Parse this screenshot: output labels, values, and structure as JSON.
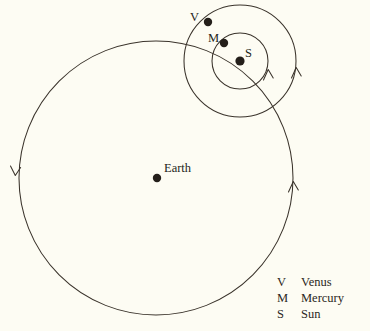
{
  "diagram": {
    "type": "orbital-diagram",
    "background_color": "#fdfcf3",
    "stroke_color": "#3a332b",
    "dot_color": "#241f1a",
    "labels": {
      "earth": "Earth",
      "venus": "V",
      "mercury": "M",
      "sun": "S"
    },
    "bodies": [
      {
        "name": "earth",
        "label": "Earth",
        "cx": 157,
        "cy": 178,
        "r": 4.2
      },
      {
        "name": "venus",
        "label": "V",
        "cx": 208,
        "cy": 22,
        "r": 4.2
      },
      {
        "name": "mercury",
        "label": "M",
        "cx": 224,
        "cy": 43,
        "r": 4.2
      },
      {
        "name": "sun",
        "label": "S",
        "cx": 240,
        "cy": 61,
        "r": 4.6
      }
    ],
    "orbits": [
      {
        "name": "sun-orbit-around-earth",
        "cx": 156,
        "cy": 178,
        "r": 137
      },
      {
        "name": "venus-orbit-around-sun",
        "cx": 240,
        "cy": 61,
        "r": 56
      },
      {
        "name": "mercury-orbit-around-sun",
        "cx": 240,
        "cy": 61,
        "r": 28
      }
    ],
    "direction_arrows": [
      {
        "name": "sun-orbit-arrow-left",
        "x": 15,
        "y": 174,
        "direction": "down"
      },
      {
        "name": "sun-orbit-arrow-right",
        "x": 293,
        "y": 184,
        "direction": "up"
      },
      {
        "name": "venus-orbit-arrow",
        "x": 296,
        "y": 69,
        "direction": "up"
      },
      {
        "name": "mercury-orbit-arrow",
        "x": 268,
        "y": 71,
        "direction": "up"
      }
    ]
  },
  "legend": {
    "rows": [
      {
        "symbol": "V",
        "name": "Venus"
      },
      {
        "symbol": "M",
        "name": "Mercury"
      },
      {
        "symbol": "S",
        "name": "Sun"
      }
    ]
  }
}
